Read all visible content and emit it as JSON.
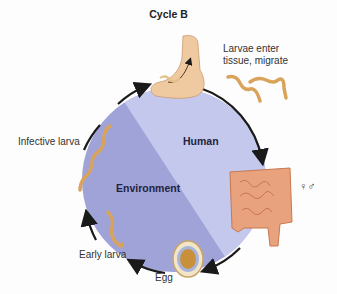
{
  "title": "Cycle B",
  "regions": {
    "human": "Human",
    "environment": "Environment"
  },
  "stages": {
    "larvae_enter": [
      "Larvae enter",
      "tissue, migrate"
    ],
    "adults": "♀♂",
    "egg": "Egg",
    "early_larva": "Early larva",
    "infective_larva": "Infective larva"
  },
  "icons": [
    "foot-icon",
    "larvae-worms-icon",
    "intestine-icon",
    "egg-icon",
    "early-larva-icon",
    "infective-larva-icon",
    "cycle-arrow-icon"
  ],
  "colors": {
    "human_region": "#c4c8ec",
    "environment_region": "#9fa3d8",
    "arrow": "#1a1a1a",
    "worm": "#d9a35b",
    "intestine": "#e8a27e"
  }
}
